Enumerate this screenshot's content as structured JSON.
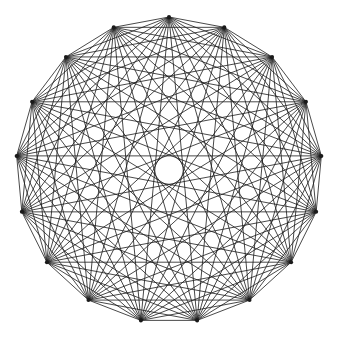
{
  "diagram": {
    "type": "complete-graph",
    "name": "K17",
    "vertex_count": 17,
    "center": [
      169,
      170
    ],
    "radius": 153,
    "start_angle_deg": -90,
    "edge_color": "#1a1a1a",
    "edge_width": 0.8,
    "background": "#ffffff"
  }
}
